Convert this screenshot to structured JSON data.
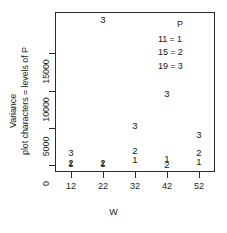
{
  "chart_data": {
    "type": "scatter",
    "title": "",
    "xlabel": "W",
    "ylabel": "Variance",
    "ylabel_secondary": "plot characters = levels of P",
    "xlim": [
      7,
      57
    ],
    "ylim": [
      -900,
      20500
    ],
    "grid": false,
    "xticks": [
      12,
      22,
      32,
      42,
      52
    ],
    "xtick_labels": [
      "12",
      "22",
      "32",
      "42",
      "52"
    ],
    "yticks": [
      0,
      5000,
      10000,
      15000
    ],
    "ytick_labels": [
      "0",
      "5000",
      "10000",
      "15000"
    ],
    "legend": {
      "title": "P",
      "position": "top-right",
      "entries": [
        {
          "value": "11",
          "separator": "=",
          "symbol": "1",
          "text": "11 = 1"
        },
        {
          "value": "15",
          "separator": "=",
          "symbol": "2",
          "text": "15 = 2"
        },
        {
          "value": "19",
          "separator": "=",
          "symbol": "3",
          "text": "19 = 3"
        }
      ]
    },
    "series": [
      {
        "name": "P = 11",
        "symbol": "1",
        "x": [
          12,
          22,
          32,
          42,
          52
        ],
        "y": [
          150,
          150,
          700,
          900,
          500
        ]
      },
      {
        "name": "P = 15",
        "symbol": "2",
        "x": [
          12,
          22,
          32,
          42,
          52
        ],
        "y": [
          250,
          250,
          1900,
          100,
          1600
        ]
      },
      {
        "name": "P = 19",
        "symbol": "3",
        "x": [
          12,
          22,
          32,
          42,
          52
        ],
        "y": [
          1600,
          19400,
          5200,
          9500,
          4000
        ]
      }
    ],
    "points": [
      {
        "label": "3",
        "x": 22,
        "y": 19400,
        "series": "P = 19"
      },
      {
        "label": "3",
        "x": 42,
        "y": 9500,
        "series": "P = 19"
      },
      {
        "label": "3",
        "x": 32,
        "y": 5200,
        "series": "P = 19"
      },
      {
        "label": "3",
        "x": 52,
        "y": 4000,
        "series": "P = 19"
      },
      {
        "label": "2",
        "x": 32,
        "y": 1900,
        "series": "P = 15"
      },
      {
        "label": "3",
        "x": 12,
        "y": 1600,
        "series": "P = 19"
      },
      {
        "label": "2",
        "x": 52,
        "y": 1600,
        "series": "P = 15"
      },
      {
        "label": "1",
        "x": 42,
        "y": 900,
        "series": "P = 11"
      },
      {
        "label": "1",
        "x": 32,
        "y": 700,
        "series": "P = 11"
      },
      {
        "label": "1",
        "x": 52,
        "y": 500,
        "series": "P = 11"
      },
      {
        "label": "2",
        "x": 12,
        "y": 250,
        "series": "P = 15"
      },
      {
        "label": "1",
        "x": 12,
        "y": 150,
        "series": "P = 11"
      },
      {
        "label": "2",
        "x": 22,
        "y": 250,
        "series": "P = 15"
      },
      {
        "label": "1",
        "x": 22,
        "y": 150,
        "series": "P = 11"
      },
      {
        "label": "2",
        "x": 42,
        "y": 100,
        "series": "P = 15"
      }
    ]
  }
}
